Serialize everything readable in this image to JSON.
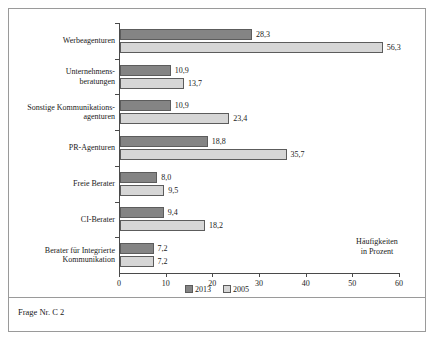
{
  "figure": {
    "footnote": "Frage Nr. C 2"
  },
  "legend": {
    "items": [
      {
        "label": "2013",
        "color": "#848484"
      },
      {
        "label": "2005",
        "color": "#d6d6d6"
      }
    ]
  },
  "axis": {
    "title_line1": "Häufigkeiten",
    "title_line2": "in Prozent",
    "ticks": [
      "0",
      "10",
      "20",
      "30",
      "40",
      "50",
      "60"
    ]
  },
  "chart_data": {
    "type": "bar",
    "orientation": "horizontal",
    "title": "",
    "subtitle": "",
    "xlabel": "Häufigkeiten in Prozent",
    "ylabel": "",
    "xlim": [
      0,
      60
    ],
    "xticks": [
      0,
      10,
      20,
      30,
      40,
      50,
      60
    ],
    "grid": false,
    "legend_position": "bottom",
    "categories": [
      "Werbeagenturen",
      "Unternehmens-\nberatungen",
      "Sonstige Kommunikations-\nagenturen",
      "PR-Agenturen",
      "Freie Berater",
      "CI-Berater",
      "Berater für Integrierte\nKommunikation"
    ],
    "series": [
      {
        "name": "2013",
        "color": "#848484",
        "values": [
          28.3,
          10.9,
          10.9,
          18.8,
          8.0,
          9.4,
          7.2
        ],
        "labels": [
          "28,3",
          "10,9",
          "10,9",
          "18,8",
          "8,0",
          "9,4",
          "7,2"
        ]
      },
      {
        "name": "2005",
        "color": "#d6d6d6",
        "values": [
          56.3,
          13.7,
          23.4,
          35.7,
          9.5,
          18.2,
          7.2
        ],
        "labels": [
          "56,3",
          "13,7",
          "23,4",
          "35,7",
          "9,5",
          "18,2",
          "7,2"
        ]
      }
    ]
  }
}
